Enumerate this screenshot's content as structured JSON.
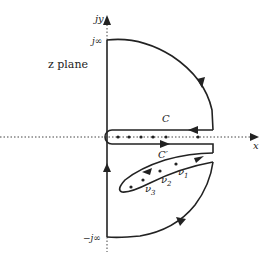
{
  "diagram": {
    "plane_label": "z plane",
    "axes": {
      "x_label": "x",
      "y_label": "jy"
    },
    "imag_labels": {
      "top": "j∞",
      "bottom": "−j∞"
    },
    "contours": {
      "upper": "C",
      "lower": "C′"
    },
    "poles": {
      "v1": "ν",
      "v1_sub": "1",
      "v2": "ν",
      "v2_sub": "2",
      "v3": "ν",
      "v3_sub": "3"
    },
    "colors": {
      "stroke": "#222222",
      "background": "#ffffff"
    }
  }
}
